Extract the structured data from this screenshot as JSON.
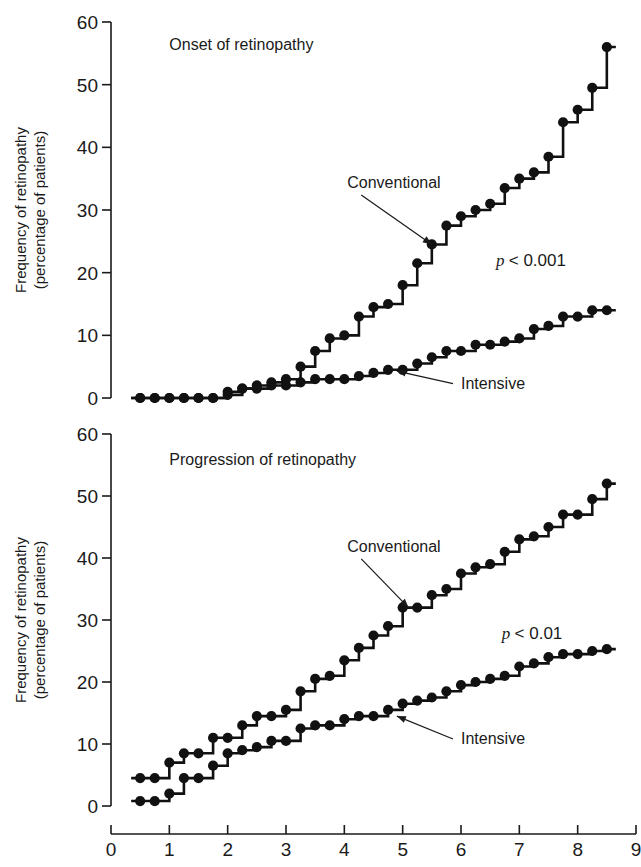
{
  "figure": {
    "background": "#ffffff",
    "ink": "#111111"
  },
  "axes": {
    "x_label": "Time (years)",
    "y_label_line1": "Frequency of retinopathy",
    "y_label_line2": "(percentage of patients)",
    "x_ticks": [
      "0",
      "1",
      "2",
      "3",
      "4",
      "5",
      "6",
      "7",
      "8",
      "9"
    ],
    "y_ticks": [
      "0",
      "10",
      "20",
      "30",
      "40",
      "50",
      "60"
    ]
  },
  "chart_data": [
    {
      "type": "line",
      "title": "Onset of retinopathy",
      "xlabel": "Time (years)",
      "ylabel": "Frequency of retinopathy (percentage of patients)",
      "xlim": [
        0,
        9
      ],
      "ylim": [
        0,
        60
      ],
      "xticks": [
        0,
        1,
        2,
        3,
        4,
        5,
        6,
        7,
        8,
        9
      ],
      "yticks": [
        0,
        10,
        20,
        30,
        40,
        50,
        60
      ],
      "grid": false,
      "legend": "inline-annotations",
      "annotations": [
        {
          "text": "Onset of retinopathy",
          "x": 1.0,
          "y": 55.5
        },
        {
          "text": "Conventional",
          "x": 4.05,
          "y": 33.5,
          "arrow_to_x": 5.5,
          "arrow_to_y": 24.5
        },
        {
          "text": "Intensive",
          "x": 6.0,
          "y": 1.5,
          "arrow_to_x": 4.9,
          "arrow_to_y": 4.3
        },
        {
          "text": "p < 0.001",
          "x": 6.6,
          "y": 21.0,
          "italic": true
        }
      ],
      "series": [
        {
          "name": "Conventional",
          "step": "post",
          "x": [
            0.5,
            0.75,
            1.0,
            1.25,
            1.5,
            1.75,
            2.0,
            2.25,
            2.5,
            2.75,
            3.0,
            3.25,
            3.5,
            3.75,
            4.0,
            4.25,
            4.5,
            4.75,
            5.0,
            5.25,
            5.5,
            5.75,
            6.0,
            6.25,
            6.5,
            6.75,
            7.0,
            7.25,
            7.5,
            7.75,
            8.0,
            8.25,
            8.5
          ],
          "values": [
            0.0,
            0.0,
            0.0,
            0.0,
            0.0,
            0.0,
            1.0,
            1.5,
            2.0,
            2.5,
            3.0,
            5.0,
            7.5,
            9.5,
            10.0,
            13.0,
            14.5,
            15.0,
            18.0,
            21.5,
            24.5,
            27.5,
            29.0,
            30.0,
            31.0,
            33.5,
            35.0,
            36.0,
            38.5,
            44.0,
            46.0,
            49.5,
            56.0
          ]
        },
        {
          "name": "Intensive",
          "step": "post",
          "x": [
            0.5,
            0.75,
            1.0,
            1.25,
            1.5,
            1.75,
            2.0,
            2.25,
            2.5,
            2.75,
            3.0,
            3.25,
            3.5,
            3.75,
            4.0,
            4.25,
            4.5,
            4.75,
            5.0,
            5.25,
            5.5,
            5.75,
            6.0,
            6.25,
            6.5,
            6.75,
            7.0,
            7.25,
            7.5,
            7.75,
            8.0,
            8.25,
            8.5
          ],
          "values": [
            0.0,
            0.0,
            0.0,
            0.0,
            0.0,
            0.0,
            0.5,
            1.5,
            1.5,
            2.0,
            2.0,
            2.5,
            3.0,
            3.0,
            3.0,
            3.5,
            4.0,
            4.5,
            4.5,
            5.5,
            6.5,
            7.5,
            7.5,
            8.5,
            8.5,
            9.0,
            9.5,
            11.0,
            11.5,
            13.0,
            13.0,
            14.0,
            14.0
          ]
        }
      ]
    },
    {
      "type": "line",
      "title": "Progression of retinopathy",
      "xlabel": "Time (years)",
      "ylabel": "Frequency of retinopathy (percentage of patients)",
      "xlim": [
        0,
        9
      ],
      "ylim": [
        0,
        60
      ],
      "xticks": [
        0,
        1,
        2,
        3,
        4,
        5,
        6,
        7,
        8,
        9
      ],
      "yticks": [
        0,
        10,
        20,
        30,
        40,
        50,
        60
      ],
      "grid": false,
      "legend": "inline-annotations",
      "annotations": [
        {
          "text": "Progression of retinopathy",
          "x": 1.0,
          "y": 55.0
        },
        {
          "text": "Conventional",
          "x": 4.05,
          "y": 41.0,
          "arrow_to_x": 5.1,
          "arrow_to_y": 32.0
        },
        {
          "text": "Intensive",
          "x": 6.0,
          "y": 10.0,
          "arrow_to_x": 4.9,
          "arrow_to_y": 14.5
        },
        {
          "text": "p < 0.01",
          "x": 6.7,
          "y": 27.0,
          "italic": true
        }
      ],
      "series": [
        {
          "name": "Conventional",
          "step": "post",
          "x": [
            0.5,
            0.75,
            1.0,
            1.25,
            1.5,
            1.75,
            2.0,
            2.25,
            2.5,
            2.75,
            3.0,
            3.25,
            3.5,
            3.75,
            4.0,
            4.25,
            4.5,
            4.75,
            5.0,
            5.25,
            5.5,
            5.75,
            6.0,
            6.25,
            6.5,
            6.75,
            7.0,
            7.25,
            7.5,
            7.75,
            8.0,
            8.25,
            8.5
          ],
          "values": [
            4.5,
            4.5,
            7.0,
            8.5,
            8.5,
            11.0,
            11.0,
            13.0,
            14.5,
            14.5,
            15.5,
            18.5,
            20.5,
            21.0,
            23.5,
            25.5,
            27.5,
            29.0,
            32.0,
            32.0,
            34.0,
            35.0,
            37.5,
            38.5,
            39.0,
            41.0,
            43.0,
            43.5,
            45.0,
            47.0,
            47.0,
            49.5,
            52.0
          ]
        },
        {
          "name": "Intensive",
          "step": "post",
          "x": [
            0.5,
            0.75,
            1.0,
            1.25,
            1.5,
            1.75,
            2.0,
            2.25,
            2.5,
            2.75,
            3.0,
            3.25,
            3.5,
            3.75,
            4.0,
            4.25,
            4.5,
            4.75,
            5.0,
            5.25,
            5.5,
            5.75,
            6.0,
            6.25,
            6.5,
            6.75,
            7.0,
            7.25,
            7.5,
            7.75,
            8.0,
            8.25,
            8.5
          ],
          "values": [
            0.8,
            0.8,
            2.0,
            4.5,
            4.5,
            6.5,
            8.5,
            9.0,
            9.5,
            10.5,
            10.5,
            12.5,
            13.0,
            13.0,
            14.0,
            14.5,
            14.5,
            15.5,
            16.5,
            17.0,
            17.5,
            18.5,
            19.5,
            20.0,
            20.5,
            21.0,
            22.5,
            23.0,
            24.0,
            24.5,
            24.5,
            25.0,
            25.3
          ]
        }
      ]
    }
  ]
}
